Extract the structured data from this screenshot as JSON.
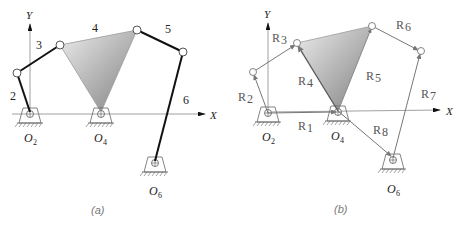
{
  "figure_a": {
    "caption": "(a)",
    "axis_x_label": "X",
    "axis_y_label": "Y",
    "link_labels": {
      "l2": "2",
      "l3": "3",
      "l4": "4",
      "l5": "5",
      "l6": "6"
    },
    "pivot_labels": {
      "o2": "O",
      "o2_sub": "2",
      "o4": "O",
      "o4_sub": "4",
      "o6": "O",
      "o6_sub": "6"
    }
  },
  "figure_b": {
    "caption": "(b)",
    "axis_x_label": "X",
    "axis_y_label": "Y",
    "vector_labels": {
      "r1": "R",
      "r1_sub": "1",
      "r2": "R",
      "r2_sub": "2",
      "r3": "R",
      "r3_sub": "3",
      "r4": "R",
      "r4_sub": "4",
      "r5": "R",
      "r5_sub": "5",
      "r6": "R",
      "r6_sub": "6",
      "r7": "R",
      "r7_sub": "7",
      "r8": "R",
      "r8_sub": "8"
    },
    "pivot_labels": {
      "o2": "O",
      "o2_sub": "2",
      "o4": "O",
      "o4_sub": "4",
      "o6": "O",
      "o6_sub": "6"
    }
  },
  "colors": {
    "link": "#111111",
    "vector": "#7a7a7a",
    "triangle_light": "#e6e6e6",
    "triangle_dark": "#8a8a8a",
    "axis": "#888888"
  }
}
